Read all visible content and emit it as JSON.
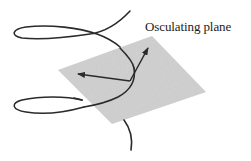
{
  "diagram": {
    "title": "Osculating plane",
    "labels": {
      "plane_label": "Osculating plane"
    },
    "elements": {
      "plane": {
        "shape": "parallelogram",
        "fill": "#c9c9c9"
      },
      "curve": {
        "shape": "helix",
        "stroke": "#2a2a2a"
      },
      "vectors": [
        {
          "name": "tangent-vector",
          "direction": "up-right"
        },
        {
          "name": "normal-vector",
          "direction": "left"
        }
      ]
    },
    "colors": {
      "background": "#ffffff",
      "plane": "#c9c9c9",
      "curve": "#2a2a2a",
      "text": "#222222"
    }
  }
}
